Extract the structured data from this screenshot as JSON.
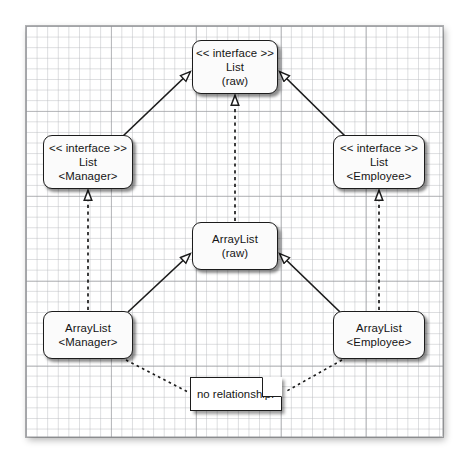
{
  "diagram": {
    "canvas": {
      "background": "#ffffff",
      "grid_minor_color": "#babcc0",
      "grid_major_color": "#96989c",
      "border_color": "#1c1c1c"
    },
    "nodes": [
      {
        "id": "list-raw",
        "name": "list-raw-interface-node",
        "lines": [
          "<< interface >>",
          "List",
          "(raw)"
        ],
        "x": 192,
        "y": 40,
        "w": 86,
        "h": 54
      },
      {
        "id": "list-manager",
        "name": "list-manager-interface-node",
        "lines": [
          "<< interface >>",
          "List",
          "<Manager>"
        ],
        "x": 43,
        "y": 135,
        "w": 90,
        "h": 54
      },
      {
        "id": "list-employee",
        "name": "list-employee-interface-node",
        "lines": [
          "<< interface >>",
          "List",
          "<Employee>"
        ],
        "x": 333,
        "y": 135,
        "w": 92,
        "h": 54
      },
      {
        "id": "arraylist-raw",
        "name": "arraylist-raw-class-node",
        "lines": [
          "ArrayList",
          "(raw)"
        ],
        "x": 192,
        "y": 222,
        "w": 86,
        "h": 48
      },
      {
        "id": "arraylist-manager",
        "name": "arraylist-manager-class-node",
        "lines": [
          "ArrayList",
          "<Manager>"
        ],
        "x": 43,
        "y": 311,
        "w": 90,
        "h": 48
      },
      {
        "id": "arraylist-employee",
        "name": "arraylist-employee-class-node",
        "lines": [
          "ArrayList",
          "<Employee>"
        ],
        "x": 333,
        "y": 311,
        "w": 92,
        "h": 48
      }
    ],
    "note": {
      "id": "note-no-relationship",
      "name": "no-relationship-note",
      "text": "no relationship!",
      "x": 190,
      "y": 377,
      "w": 92,
      "h": 34
    },
    "edges": [
      {
        "id": "gen-list-manager-to-list-raw",
        "name": "generalization-list-manager-to-list-raw",
        "from": "list-manager",
        "to": "list-raw",
        "style": "solid",
        "arrow": "hollow-triangle",
        "relationship": "generalization"
      },
      {
        "id": "gen-list-employee-to-list-raw",
        "name": "generalization-list-employee-to-list-raw",
        "from": "list-employee",
        "to": "list-raw",
        "style": "solid",
        "arrow": "hollow-triangle",
        "relationship": "generalization"
      },
      {
        "id": "real-arraylist-raw-to-list-raw",
        "name": "realization-arraylist-raw-to-list-raw",
        "from": "arraylist-raw",
        "to": "list-raw",
        "style": "dashed",
        "arrow": "hollow-triangle",
        "relationship": "realization"
      },
      {
        "id": "real-arraylist-manager-to-list-manager",
        "name": "realization-arraylist-manager-to-list-manager",
        "from": "arraylist-manager",
        "to": "list-manager",
        "style": "dashed",
        "arrow": "hollow-triangle",
        "relationship": "realization"
      },
      {
        "id": "real-arraylist-employee-to-list-employee",
        "name": "realization-arraylist-employee-to-list-employee",
        "from": "arraylist-employee",
        "to": "list-employee",
        "style": "dashed",
        "arrow": "hollow-triangle",
        "relationship": "realization"
      },
      {
        "id": "gen-arraylist-manager-to-arraylist-raw",
        "name": "generalization-arraylist-manager-to-arraylist-raw",
        "from": "arraylist-manager",
        "to": "arraylist-raw",
        "style": "solid",
        "arrow": "hollow-triangle",
        "relationship": "generalization"
      },
      {
        "id": "gen-arraylist-employee-to-arraylist-raw",
        "name": "generalization-arraylist-employee-to-arraylist-raw",
        "from": "arraylist-employee",
        "to": "arraylist-raw",
        "style": "solid",
        "arrow": "hollow-triangle",
        "relationship": "generalization"
      },
      {
        "id": "dep-arraylist-manager-to-note",
        "name": "dashed-link-arraylist-manager-to-note",
        "from": "arraylist-manager",
        "to": "note",
        "style": "dotted",
        "arrow": "none",
        "relationship": "note-anchor"
      },
      {
        "id": "dep-arraylist-employee-to-note",
        "name": "dashed-link-arraylist-employee-to-note",
        "from": "arraylist-employee",
        "to": "note",
        "style": "dotted",
        "arrow": "none",
        "relationship": "note-anchor"
      }
    ]
  }
}
